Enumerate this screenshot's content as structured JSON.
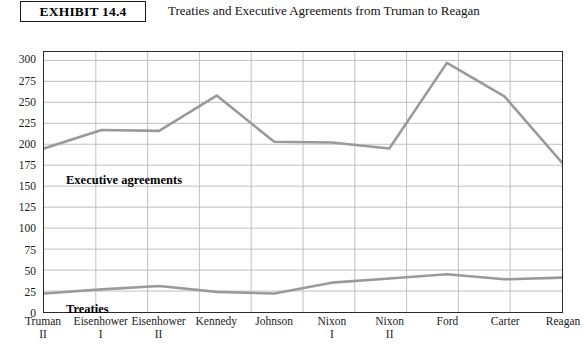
{
  "header": {
    "exhibit_label": "EXHIBIT 14.4",
    "title": "Treaties and Executive Agreements from Truman to Reagan"
  },
  "series_labels": {
    "executive": "Executive agreements",
    "treaties": "Treaties"
  },
  "axis": {
    "y_ticks": [
      "0",
      "25",
      "50",
      "75",
      "100",
      "125",
      "150",
      "175",
      "200",
      "225",
      "250",
      "275",
      "300"
    ],
    "x_labels": [
      {
        "name": "Truman",
        "sub": "II"
      },
      {
        "name": "Eisenhower",
        "sub": "I"
      },
      {
        "name": "Eisenhower",
        "sub": "II"
      },
      {
        "name": "Kennedy",
        "sub": ""
      },
      {
        "name": "Johnson",
        "sub": ""
      },
      {
        "name": "Nixon",
        "sub": "I"
      },
      {
        "name": "Nixon",
        "sub": "II"
      },
      {
        "name": "Ford",
        "sub": ""
      },
      {
        "name": "Carter",
        "sub": ""
      },
      {
        "name": "Reagan",
        "sub": ""
      }
    ]
  },
  "colors": {
    "line": "#9a9a9a",
    "grid": "#b8b8b8",
    "frame": "#2a2a2a",
    "text": "#111111"
  },
  "chart_data": {
    "type": "line",
    "title": "Treaties and Executive Agreements from Truman to Reagan",
    "xlabel": "",
    "ylabel": "",
    "ylim": [
      0,
      310
    ],
    "yticks": [
      0,
      25,
      50,
      75,
      100,
      125,
      150,
      175,
      200,
      225,
      250,
      275,
      300
    ],
    "grid": true,
    "legend": "inline-labels",
    "categories": [
      "Truman II",
      "Eisenhower I",
      "Eisenhower II",
      "Kennedy",
      "Johnson",
      "Nixon I",
      "Nixon II",
      "Ford",
      "Carter",
      "Reagan"
    ],
    "series": [
      {
        "name": "Executive agreements",
        "values": [
          195,
          217,
          216,
          258,
          203,
          202,
          195,
          297,
          257,
          178
        ]
      },
      {
        "name": "Treaties",
        "values": [
          22,
          27,
          31,
          24,
          22,
          35,
          40,
          45,
          39,
          41
        ]
      }
    ]
  }
}
